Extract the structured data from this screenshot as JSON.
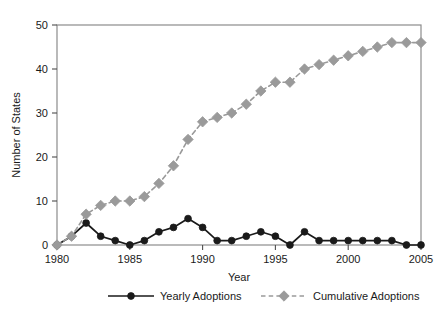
{
  "chart_data": {
    "type": "line",
    "title": "",
    "subtitle": "",
    "xlabel": "Year",
    "ylabel": "Number of States",
    "x": [
      1980,
      1981,
      1982,
      1983,
      1984,
      1985,
      1986,
      1987,
      1988,
      1989,
      1990,
      1991,
      1992,
      1993,
      1994,
      1995,
      1996,
      1997,
      1998,
      1999,
      2000,
      2001,
      2002,
      2003,
      2004,
      2005
    ],
    "xlim": [
      1980,
      2005
    ],
    "ylim": [
      0,
      50
    ],
    "xticks": [
      1980,
      1985,
      1990,
      1995,
      2000,
      2005
    ],
    "xtick_labels": [
      "1980",
      "1985",
      "1990",
      "1995",
      "2000",
      "2005"
    ],
    "yticks": [
      0,
      10,
      20,
      30,
      40,
      50
    ],
    "ytick_labels": [
      "0",
      "10",
      "20",
      "30",
      "40",
      "50"
    ],
    "grid": false,
    "legend_position": "bottom",
    "series": [
      {
        "name": "Yearly Adoptions",
        "color": "#1a1a1a",
        "marker": "circle",
        "linestyle": "solid",
        "values": [
          0,
          2,
          5,
          2,
          1,
          0,
          1,
          3,
          4,
          6,
          4,
          1,
          1,
          2,
          3,
          2,
          0,
          3,
          1,
          1,
          1,
          1,
          1,
          1,
          0,
          0
        ]
      },
      {
        "name": "Cumulative Adoptions",
        "color": "#9a9a9a",
        "marker": "diamond",
        "linestyle": "dashed",
        "values": [
          0,
          2,
          7,
          9,
          10,
          10,
          11,
          14,
          18,
          24,
          28,
          29,
          30,
          32,
          35,
          37,
          37,
          40,
          41,
          42,
          43,
          44,
          45,
          46,
          46,
          46
        ]
      }
    ]
  },
  "legend": {
    "items": [
      {
        "label": "Yearly Adoptions"
      },
      {
        "label": "Cumulative Adoptions"
      }
    ]
  },
  "colors": {
    "yearly": "#1a1a1a",
    "cumulative": "#9a9a9a",
    "frame": "#8c8c8c",
    "text": "#1a1a1a",
    "background": "#ffffff"
  }
}
